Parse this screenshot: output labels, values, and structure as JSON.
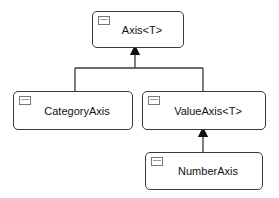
{
  "diagram": {
    "type": "class-hierarchy",
    "nodes": [
      {
        "id": "axis",
        "label": "Axis<T>",
        "icon": "class-window-icon"
      },
      {
        "id": "category_axis",
        "label": "CategoryAxis",
        "icon": "class-window-icon"
      },
      {
        "id": "value_axis",
        "label": "ValueAxis<T>",
        "icon": "class-window-icon"
      },
      {
        "id": "number_axis",
        "label": "NumberAxis",
        "icon": "class-window-icon"
      }
    ],
    "edges": [
      {
        "from": "category_axis",
        "to": "axis",
        "kind": "inherits"
      },
      {
        "from": "value_axis",
        "to": "axis",
        "kind": "inherits"
      },
      {
        "from": "number_axis",
        "to": "value_axis",
        "kind": "inherits"
      }
    ],
    "colors": {
      "stroke": "#3a3a3a",
      "fill": "#ffffff",
      "text": "#111111"
    }
  }
}
